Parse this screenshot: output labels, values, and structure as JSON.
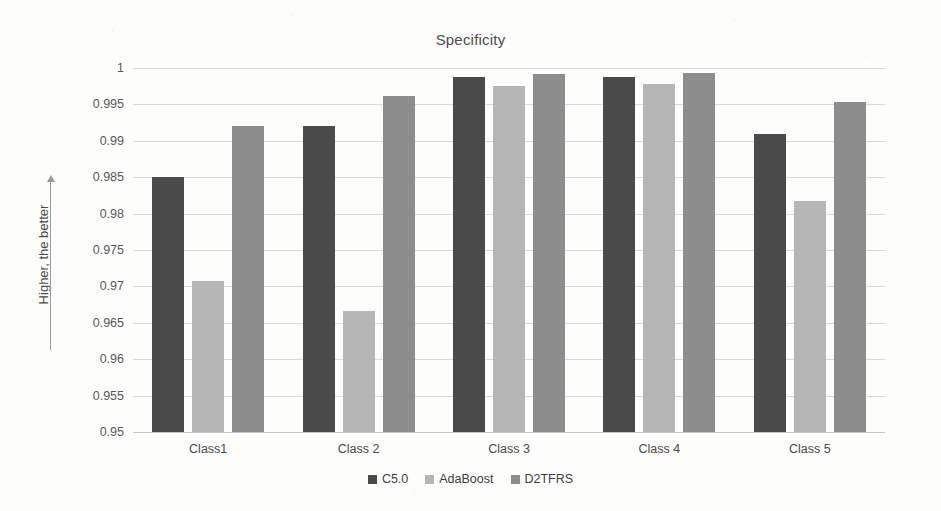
{
  "chart_data": {
    "type": "bar",
    "title": "Specificity",
    "xlabel": "",
    "ylabel": "Higher, the better",
    "ylim": [
      0.95,
      1
    ],
    "ytick_labels": [
      "1",
      "0.995",
      "0.99",
      "0.985",
      "0.98",
      "0.975",
      "0.97",
      "0.965",
      "0.96",
      "0.955",
      "0.95"
    ],
    "ytick_values": [
      1,
      0.995,
      0.99,
      0.985,
      0.98,
      0.975,
      0.97,
      0.965,
      0.96,
      0.955,
      0.95
    ],
    "grid": true,
    "legend_position": "bottom",
    "categories": [
      "Class1",
      "Class 2",
      "Class 3",
      "Class 4",
      "Class 5"
    ],
    "series": [
      {
        "name": "C5.0",
        "color": "#4b4b4b",
        "values": [
          0.985,
          0.992,
          0.9988,
          0.9988,
          0.991
        ]
      },
      {
        "name": "AdaBoost",
        "color": "#b6b6b6",
        "values": [
          0.9707,
          0.9666,
          0.9975,
          0.9978,
          0.9818
        ]
      },
      {
        "name": "D2TFRS",
        "color": "#8d8d8d",
        "values": [
          0.992,
          0.9961,
          0.9992,
          0.9993,
          0.9953
        ]
      }
    ]
  }
}
